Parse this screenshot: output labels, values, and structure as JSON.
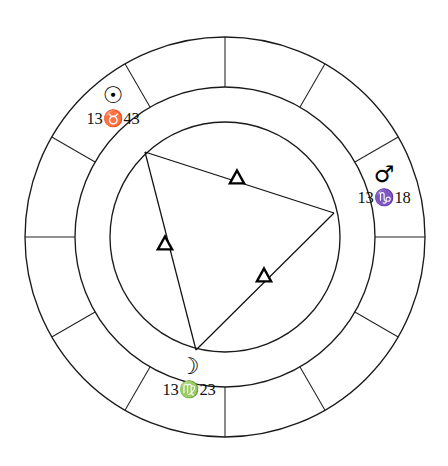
{
  "chart": {
    "type": "zodiac-wheel",
    "center": {
      "x": 225,
      "y": 237
    },
    "radii": {
      "outer": 200,
      "middle": 150,
      "inner": 115
    },
    "house_count": 12,
    "spoke_start_angle_deg": -90,
    "spoke_step_deg": 30,
    "colors": {
      "stroke": "#1a1a1a",
      "spoke": "#222222",
      "aspect": "#111111",
      "background": "#ffffff",
      "marker_fill": "#ffffff"
    }
  },
  "planets": [
    {
      "id": "sun",
      "name": "Sun",
      "glyph": "☉",
      "glyph_name": "sun-glyph",
      "degree": "13",
      "sign": "♉",
      "sign_name": "Taurus",
      "minute": "43",
      "label": "13♉43",
      "vertex": {
        "x": 145,
        "y": 152
      }
    },
    {
      "id": "mars",
      "name": "Mars",
      "glyph": "♂",
      "glyph_name": "mars-glyph",
      "degree": "13",
      "sign": "♑",
      "sign_name": "Capricorn",
      "minute": "18",
      "label": "13♑18",
      "vertex": {
        "x": 334,
        "y": 213
      }
    },
    {
      "id": "moon",
      "name": "Moon",
      "glyph": "☽",
      "glyph_name": "moon-glyph",
      "degree": "13",
      "sign": "♍",
      "sign_name": "Virgo",
      "minute": "23",
      "label": "13♍23",
      "vertex": {
        "x": 196,
        "y": 350
      }
    }
  ],
  "aspects": [
    {
      "id": "sun-mars-trine",
      "type": "trine",
      "glyph": "△",
      "from": "sun",
      "to": "mars",
      "marker": {
        "x": 237,
        "y": 178
      }
    },
    {
      "id": "sun-moon-trine",
      "type": "trine",
      "glyph": "△",
      "from": "sun",
      "to": "moon",
      "marker": {
        "x": 165,
        "y": 244
      }
    },
    {
      "id": "mars-moon-trine",
      "type": "trine",
      "glyph": "△",
      "from": "mars",
      "to": "moon",
      "marker": {
        "x": 264,
        "y": 276
      }
    }
  ],
  "chart_data": {
    "type": "pie",
    "categories": [
      "House 1",
      "House 2",
      "House 3",
      "House 4",
      "House 5",
      "House 6",
      "House 7",
      "House 8",
      "House 9",
      "House 10",
      "House 11",
      "House 12"
    ],
    "values": [
      30,
      30,
      30,
      30,
      30,
      30,
      30,
      30,
      30,
      30,
      30,
      30
    ],
    "xlabel": "",
    "ylabel": "",
    "legend": false,
    "grid": false,
    "annotations": [
      "☉ 13♉43",
      "♂ 13♑18",
      "☽ 13♍23",
      "△ trine",
      "△ trine",
      "△ trine"
    ]
  }
}
